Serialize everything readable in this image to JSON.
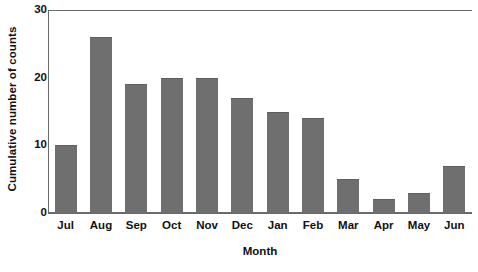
{
  "chart_data": {
    "type": "bar",
    "title": "",
    "subtitle": "",
    "xlabel": "Month",
    "ylabel": "Cumulative number of counts",
    "categories": [
      "Jul",
      "Aug",
      "Sep",
      "Oct",
      "Nov",
      "Dec",
      "Jan",
      "Feb",
      "Mar",
      "Apr",
      "May",
      "Jun"
    ],
    "values": [
      10,
      26,
      19,
      20,
      20,
      17,
      15,
      14,
      5,
      2,
      3,
      7
    ],
    "ylim": [
      0,
      30
    ],
    "yticks": [
      0,
      10,
      20,
      30
    ],
    "ytick_labels": [
      "0",
      "10",
      "20",
      "30"
    ],
    "xtick_labels": [
      "Jul",
      "Aug",
      "Sep",
      "Oct",
      "Nov",
      "Dec",
      "Jan",
      "Feb",
      "Mar",
      "Apr",
      "May",
      "Jun"
    ],
    "grid": false,
    "legend": null,
    "legend_position": "none",
    "bar_color": "#6f6f6f",
    "axis_color": "#6a6a6a",
    "background_color": "#ffffff",
    "text_color": "#111111",
    "annotations": []
  },
  "axes": {
    "y_title": "Cumulative number of counts",
    "x_title": "Month"
  }
}
